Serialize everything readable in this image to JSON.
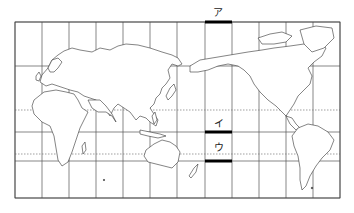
{
  "map": {
    "projection": "world map centered on Pacific (Mercator-like), 30-degree graticule",
    "frame": {
      "left": 15,
      "top": 22,
      "right": 340,
      "bottom": 198
    },
    "meridians_x": [
      15,
      42,
      69,
      96,
      123,
      150,
      177,
      205,
      232,
      259,
      286,
      313,
      340
    ],
    "parallels_solid_y": [
      22,
      66,
      132,
      161,
      198
    ],
    "parallels_dotted_y": [
      110,
      154
    ],
    "highlight_bars": [
      {
        "id": "a",
        "label": "ア",
        "x1": 205,
        "x2": 232,
        "y": 22
      },
      {
        "id": "i",
        "label": "イ",
        "x1": 205,
        "x2": 232,
        "y": 132
      },
      {
        "id": "u",
        "label": "ウ",
        "x1": 205,
        "x2": 232,
        "y": 161
      }
    ],
    "labels": {
      "a": "ア",
      "i": "イ",
      "u": "ウ"
    },
    "colors": {
      "grid": "#555555",
      "coast": "#333333",
      "bar": "#000000",
      "background": "#ffffff"
    }
  }
}
